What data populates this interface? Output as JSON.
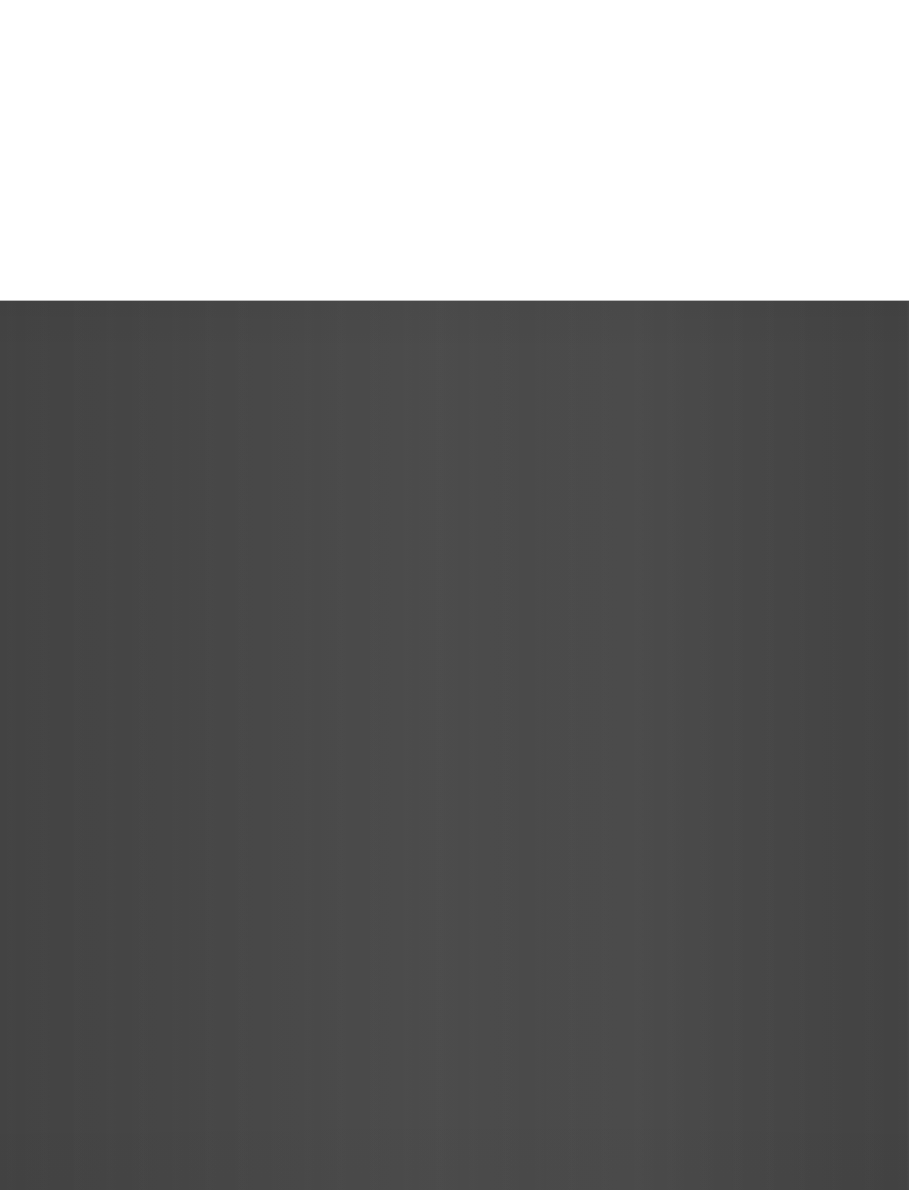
{
  "window": {
    "title": "",
    "state": "blank-loading",
    "width": 909,
    "height": 1190
  },
  "top_panel": {
    "label": "",
    "background_color": "#ffffff",
    "height": 301,
    "content": ""
  },
  "content_panel": {
    "label": "",
    "background_color": "#434343",
    "accent_color": "#4a4a4a",
    "edge_color": "#3d3d3d",
    "top": 301,
    "height": 889,
    "content": ""
  },
  "divider": {
    "color": "#b9b9b9",
    "y": 300
  }
}
